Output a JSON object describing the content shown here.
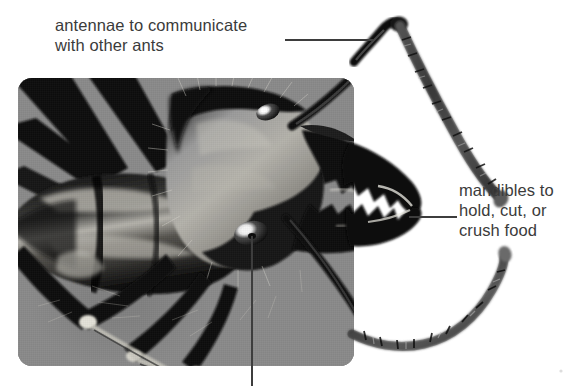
{
  "figure": {
    "background_color": "#ffffff",
    "photo_background_color": "#878787",
    "text_color": "#3b3b3b",
    "leader_line_color": "#3d3d3d"
  },
  "labels": {
    "antennae": {
      "text": "antennae to communicate\nwith other ants",
      "line1": "antennae to communicate",
      "line2": "with other ants"
    },
    "mandibles": {
      "text": "mandibles to\nhold, cut, or\ncrush food",
      "line1": "mandibles to",
      "line2": "hold, cut, or",
      "line3": "crush food"
    }
  },
  "leaders": [
    {
      "name": "antennae-leader",
      "orientation": "horizontal",
      "points_to": "upper antenna elbow"
    },
    {
      "name": "mandibles-leader",
      "orientation": "horizontal",
      "points_to": "lower mandible tip"
    },
    {
      "name": "head-leader",
      "orientation": "vertical",
      "points_to": "ant eye",
      "label": ""
    }
  ],
  "photo": {
    "alt": "black and white macro photograph of an ant head in profile",
    "caption": ""
  }
}
